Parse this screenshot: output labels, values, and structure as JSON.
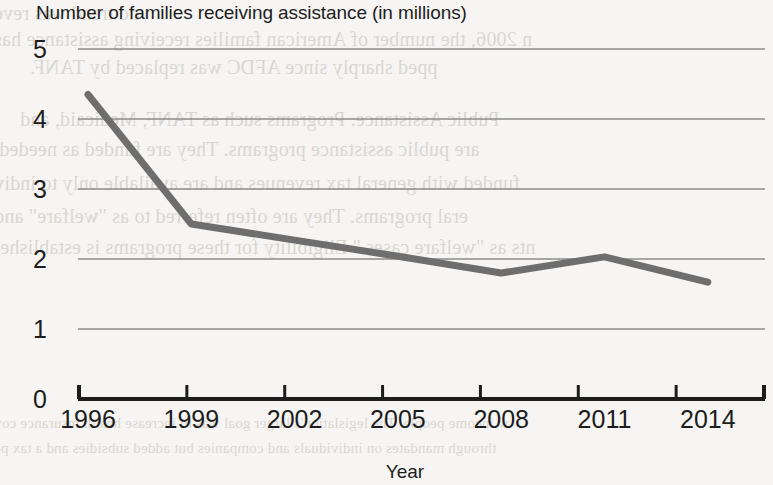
{
  "page": {
    "background_color": "#f6f5f3",
    "ink_color": "#1d1d1d"
  },
  "bleed_through_text": [
    "nd trend was reve",
    "n 2006, the number of American families receiving assistance has",
    "pped sharply since AFDC was replaced by TANF.",
    "Public Assistance.  Programs such as TANF, Medicaid, and",
    "are public assistance programs. They are funded as needed,",
    "funded with general tax revenues and are available only to indiv",
    "eral programs. They are often referred to as \"welfare\" and",
    "nts as \"welfare cases.\" Eligibility for these programs is established",
    "w income people. The legislation's larger goal was to increase health insurance cov",
    "through mandates on individuals and companies but added subsidies and a tax pe"
  ],
  "chart_data": {
    "type": "line",
    "title": "Number of families receiving assistance (in millions)",
    "xlabel": "Year",
    "ylabel": "",
    "categories": [
      "1996",
      "1999",
      "2002",
      "2005",
      "2008",
      "2011",
      "2014"
    ],
    "values": [
      4.35,
      2.5,
      2.27,
      2.04,
      1.8,
      2.03,
      1.67
    ],
    "series": [
      {
        "name": "Number of families receiving assistance",
        "values": [
          4.35,
          2.5,
          2.27,
          2.04,
          1.8,
          2.03,
          1.67
        ]
      }
    ],
    "ylim": [
      0,
      5
    ],
    "yticks": [
      "0",
      "1",
      "2",
      "3",
      "4",
      "5"
    ],
    "ytick_values": [
      0,
      1,
      2,
      3,
      4,
      5
    ],
    "xlim": [
      "1996",
      "2014"
    ],
    "grid": "horizontal",
    "legend": "none",
    "line_color": "#6e6e6e",
    "grid_color": "#8b8b8b",
    "axis_color": "#1d1d1d",
    "line_width": 7,
    "markers": "none"
  }
}
